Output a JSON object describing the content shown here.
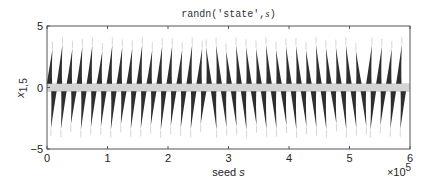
{
  "chart_data": {
    "type": "scatter",
    "title_prefix": "randn('state',",
    "title_var": "s",
    "title_suffix": ")",
    "xlabel_prefix": "seed ",
    "xlabel_var": "s",
    "ylabel_main": "x",
    "ylabel_sub": "1,5",
    "x_multiplier_label": "×10",
    "x_multiplier_exp": "5",
    "xlim": [
      0,
      6
    ],
    "ylim": [
      -5,
      5
    ],
    "xticks": [
      0,
      1,
      2,
      3,
      4,
      5,
      6
    ],
    "xtick_labels": [
      "0",
      "1",
      "2",
      "3",
      "4",
      "5",
      "6"
    ],
    "yticks": [
      -5,
      0,
      5
    ],
    "ytick_labels": [
      "−5",
      "0",
      "5"
    ],
    "grid": false,
    "marker_color": "#111111",
    "spike_spacing": 0.165,
    "spike_peak": 3.5,
    "symmetry_points": [
      0,
      2.63,
      5.3
    ]
  }
}
